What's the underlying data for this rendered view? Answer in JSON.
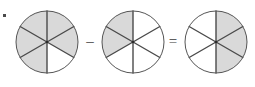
{
  "canvas": {
    "width": 255,
    "height": 87,
    "background": "#ffffff"
  },
  "style": {
    "shaded_fill": "#d9d9d9",
    "empty_fill": "#ffffff",
    "outline_stroke": "#555555",
    "divider_stroke": "#4a4a4a",
    "outline_width": 1,
    "divider_width": 1.4,
    "hub_color": "#2b2b2b",
    "operator_color": "#3b3b3b",
    "speck_color": "#4a4a4a"
  },
  "equation": {
    "expression": "5/6 - 2/6 = 3/6",
    "denominator": 6,
    "minuend": 5,
    "subtrahend": 2,
    "difference": 3
  },
  "chart_data": {
    "type": "pie",
    "title": "",
    "sector_count": 6,
    "sector_angle_degrees": 60,
    "start_angle_degrees": -90,
    "legend": [],
    "grid": false,
    "charts": [
      {
        "name": "minuend-pie",
        "label": "5/6",
        "shaded_count": 5,
        "total_count": 6,
        "value": 0.8333,
        "center_x": 47,
        "center_y": 42,
        "radius": 31,
        "sectors": [
          {
            "index": 0,
            "from_deg": -90,
            "to_deg": -30,
            "shaded": true
          },
          {
            "index": 1,
            "from_deg": -30,
            "to_deg": 30,
            "shaded": true
          },
          {
            "index": 2,
            "from_deg": 30,
            "to_deg": 90,
            "shaded": false
          },
          {
            "index": 3,
            "from_deg": 90,
            "to_deg": 150,
            "shaded": true
          },
          {
            "index": 4,
            "from_deg": 150,
            "to_deg": 210,
            "shaded": true
          },
          {
            "index": 5,
            "from_deg": 210,
            "to_deg": 270,
            "shaded": true
          }
        ]
      },
      {
        "name": "subtrahend-pie",
        "label": "2/6",
        "shaded_count": 2,
        "total_count": 6,
        "value": 0.3333,
        "center_x": 133,
        "center_y": 42,
        "radius": 31,
        "sectors": [
          {
            "index": 0,
            "from_deg": -90,
            "to_deg": -30,
            "shaded": false
          },
          {
            "index": 1,
            "from_deg": -30,
            "to_deg": 30,
            "shaded": false
          },
          {
            "index": 2,
            "from_deg": 30,
            "to_deg": 90,
            "shaded": false
          },
          {
            "index": 3,
            "from_deg": 90,
            "to_deg": 150,
            "shaded": false
          },
          {
            "index": 4,
            "from_deg": 150,
            "to_deg": 210,
            "shaded": true
          },
          {
            "index": 5,
            "from_deg": 210,
            "to_deg": 270,
            "shaded": true
          }
        ]
      },
      {
        "name": "difference-pie",
        "label": "3/6",
        "shaded_count": 3,
        "total_count": 6,
        "value": 0.5,
        "center_x": 216,
        "center_y": 42,
        "radius": 31,
        "sectors": [
          {
            "index": 0,
            "from_deg": -90,
            "to_deg": -30,
            "shaded": true
          },
          {
            "index": 1,
            "from_deg": -30,
            "to_deg": 30,
            "shaded": true
          },
          {
            "index": 2,
            "from_deg": 30,
            "to_deg": 90,
            "shaded": true
          },
          {
            "index": 3,
            "from_deg": 90,
            "to_deg": 150,
            "shaded": false
          },
          {
            "index": 4,
            "from_deg": 150,
            "to_deg": 210,
            "shaded": false
          },
          {
            "index": 5,
            "from_deg": 210,
            "to_deg": 270,
            "shaded": false
          }
        ]
      }
    ],
    "operators": [
      {
        "name": "minus-operator",
        "symbol": "–",
        "x": 90,
        "y": 43
      },
      {
        "name": "equals-operator",
        "symbol": "=",
        "x": 173,
        "y": 43
      }
    ]
  },
  "artifacts": {
    "corner_speck": {
      "x": 3,
      "y": 14,
      "width": 3,
      "height": 3
    }
  }
}
